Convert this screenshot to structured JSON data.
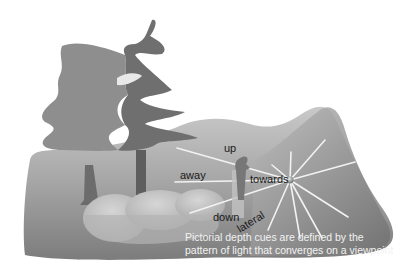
{
  "diagram": {
    "labels": {
      "up": "up",
      "away": "away",
      "towards": "towards",
      "down": "down",
      "lateral": "lateral"
    },
    "caption": {
      "line1": "Pictorial depth cues are defined by the",
      "line2": "pattern of light that converges on a viewpoint"
    },
    "colors": {
      "background": "#ffffff",
      "ground_dark": "#7a7a7a",
      "ground_light": "#c8c8c8",
      "tree_light": "#8f8f8f",
      "tree_dark": "#6e6e6e",
      "rays": "#f0f0f0"
    }
  }
}
